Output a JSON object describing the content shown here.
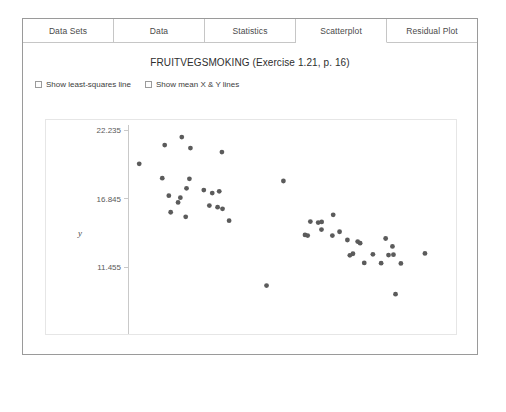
{
  "window": {
    "tabs": [
      {
        "label": "Data Sets",
        "active": false
      },
      {
        "label": "Data",
        "active": false
      },
      {
        "label": "Statistics",
        "active": false
      },
      {
        "label": "Scatterplot",
        "active": true
      },
      {
        "label": "Residual Plot",
        "active": false
      }
    ]
  },
  "options": [
    {
      "label": "Show least-squares line",
      "checked": false
    },
    {
      "label": "Show mean X & Y lines",
      "checked": false
    }
  ],
  "colors": {
    "point": "#5b5b5b",
    "axis": "#c9c9c9",
    "panel_border": "#9a9a9a",
    "tab_border": "#c6c6c6",
    "text": "#4a4a4a"
  },
  "chart_data": {
    "type": "scatter",
    "title": "FRUITVEGSMOKING (Exercise 1.21, p. 16)",
    "xlabel": "x",
    "ylabel": "y",
    "xlim": [
      15.615,
      30.685
    ],
    "ylim": [
      6.065,
      22.235
    ],
    "xticks": [
      15.615,
      20.638,
      25.662,
      30.685
    ],
    "xtick_labels": [
      "15.615",
      "20.638",
      "25.662",
      "30.685"
    ],
    "yticks": [
      6.065,
      11.455,
      16.845,
      22.235
    ],
    "ytick_labels": [
      "6.065",
      "11.455",
      "16.845",
      "22.235"
    ],
    "grid": false,
    "legend": false,
    "marker": "circle",
    "marker_size": 3,
    "series": [
      {
        "name": "FRUITVEGSMOKING",
        "points": [
          [
            18.23,
            21.68
          ],
          [
            17.4,
            21.05
          ],
          [
            18.65,
            20.82
          ],
          [
            20.18,
            20.5
          ],
          [
            16.16,
            19.58
          ],
          [
            17.28,
            18.45
          ],
          [
            18.6,
            18.4
          ],
          [
            23.17,
            18.23
          ],
          [
            18.46,
            17.66
          ],
          [
            19.3,
            17.52
          ],
          [
            20.05,
            17.42
          ],
          [
            19.71,
            17.28
          ],
          [
            17.6,
            17.08
          ],
          [
            18.16,
            16.92
          ],
          [
            18.05,
            16.55
          ],
          [
            19.57,
            16.3
          ],
          [
            19.97,
            16.18
          ],
          [
            20.21,
            16.05
          ],
          [
            17.69,
            15.78
          ],
          [
            18.42,
            15.42
          ],
          [
            20.53,
            15.12
          ],
          [
            24.48,
            15.05
          ],
          [
            24.86,
            14.97
          ],
          [
            25.03,
            15.02
          ],
          [
            25.59,
            15.58
          ],
          [
            24.35,
            13.95
          ],
          [
            25.02,
            14.42
          ],
          [
            25.55,
            13.95
          ],
          [
            25.9,
            14.25
          ],
          [
            24.22,
            14.0
          ],
          [
            26.28,
            13.6
          ],
          [
            26.78,
            13.48
          ],
          [
            26.9,
            13.35
          ],
          [
            28.14,
            13.72
          ],
          [
            28.47,
            13.1
          ],
          [
            26.55,
            12.52
          ],
          [
            26.4,
            12.4
          ],
          [
            27.52,
            12.48
          ],
          [
            28.28,
            12.42
          ],
          [
            28.52,
            12.45
          ],
          [
            30.05,
            12.55
          ],
          [
            27.1,
            11.8
          ],
          [
            27.92,
            11.78
          ],
          [
            28.88,
            11.76
          ],
          [
            22.35,
            10.02
          ],
          [
            28.62,
            9.35
          ]
        ]
      }
    ]
  }
}
